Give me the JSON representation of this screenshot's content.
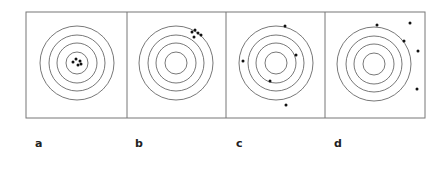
{
  "figure": {
    "colors": {
      "ring": "#555555",
      "border": "#777777",
      "dot": "#111111"
    },
    "panels": [
      {
        "label": "a",
        "x0": 26,
        "x1": 127,
        "center": [
          77,
          63
        ],
        "dots": [
          [
            73,
            62
          ],
          [
            76,
            59
          ],
          [
            80,
            61
          ],
          [
            78,
            65
          ],
          [
            81,
            64
          ]
        ]
      },
      {
        "label": "b",
        "x0": 127,
        "x1": 226,
        "center": [
          176,
          63
        ],
        "dots": [
          [
            192,
            32
          ],
          [
            195,
            30
          ],
          [
            198,
            33
          ],
          [
            201,
            35
          ],
          [
            194,
            37
          ]
        ]
      },
      {
        "label": "c",
        "x0": 226,
        "x1": 325,
        "center": [
          276,
          63
        ],
        "dots": [
          [
            285,
            26
          ],
          [
            243,
            61
          ],
          [
            296,
            55
          ],
          [
            270,
            81
          ],
          [
            286,
            105
          ]
        ]
      },
      {
        "label": "d",
        "x0": 325,
        "x1": 425,
        "center": [
          374,
          64
        ],
        "dots": [
          [
            377,
            25
          ],
          [
            410,
            23
          ],
          [
            404,
            41
          ],
          [
            418,
            51
          ],
          [
            417,
            89
          ]
        ]
      }
    ],
    "ring_radii": [
      11,
      20,
      28,
      37
    ]
  }
}
